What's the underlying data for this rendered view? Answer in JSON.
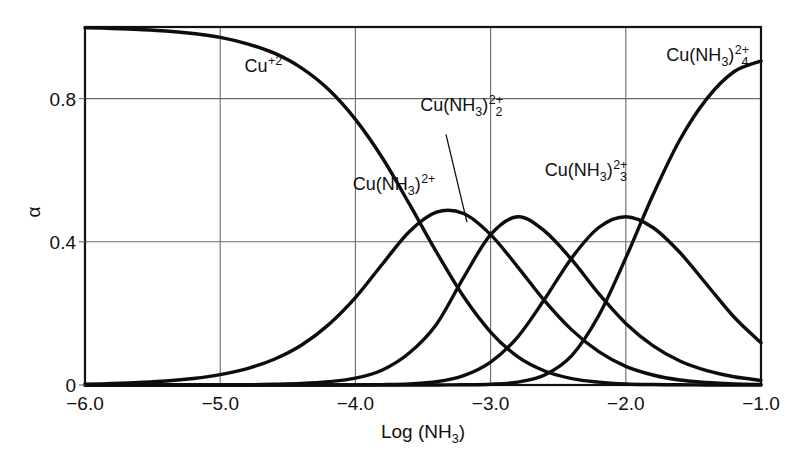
{
  "chart_data": {
    "type": "line",
    "title": "",
    "xlabel_parts": {
      "main": "Log (NH",
      "sub": "3",
      "tail": ")"
    },
    "xlabel": "Log (NH3)",
    "ylabel": "α",
    "xlim": [
      -6.0,
      -1.0
    ],
    "ylim": [
      0.0,
      1.0
    ],
    "xticks": [
      -6.0,
      -5.0,
      -4.0,
      -3.0,
      -2.0,
      -1.0
    ],
    "xtick_labels": [
      "−6.0",
      "−5.0",
      "−4.0",
      "−3.0",
      "−2.0",
      "−1.0"
    ],
    "yticks": [
      0,
      0.4,
      0.8
    ],
    "ytick_labels": [
      "0",
      "0.4",
      "0.8"
    ],
    "grid": "both",
    "legend": "inline-labels",
    "axis_color": "#111111",
    "grid_color": "#6b6b6b",
    "curve_color": "#0d0d0d",
    "background": "#ffffff",
    "x": [
      -6.0,
      -5.8,
      -5.6,
      -5.4,
      -5.2,
      -5.0,
      -4.8,
      -4.6,
      -4.4,
      -4.2,
      -4.0,
      -3.8,
      -3.6,
      -3.4,
      -3.2,
      -3.0,
      -2.8,
      -2.6,
      -2.4,
      -2.2,
      -2.0,
      -1.8,
      -1.6,
      -1.4,
      -1.2,
      -1.0
    ],
    "series": [
      {
        "name": "Cu+2",
        "label_parts": {
          "main": "Cu",
          "sup": "+2"
        },
        "label_x": -4.82,
        "label_y": 0.875,
        "values": [
          0.998,
          0.996,
          0.993,
          0.989,
          0.982,
          0.971,
          0.953,
          0.927,
          0.886,
          0.826,
          0.742,
          0.634,
          0.505,
          0.371,
          0.247,
          0.148,
          0.079,
          0.039,
          0.018,
          0.008,
          0.003,
          0.0013,
          0.0005,
          0.0002,
          0.0001,
          0.0
        ]
      },
      {
        "name": "Cu(NH3)+2",
        "label_parts": {
          "main": "Cu(NH",
          "sub": "3",
          "mid": ")",
          "sup": "2+"
        },
        "label_x": -4.02,
        "label_y": 0.545,
        "peak_x": -3.8,
        "peak_y": 0.49,
        "values": [
          0.002,
          0.004,
          0.007,
          0.011,
          0.018,
          0.029,
          0.046,
          0.072,
          0.111,
          0.168,
          0.244,
          0.338,
          0.429,
          0.483,
          0.479,
          0.42,
          0.33,
          0.235,
          0.154,
          0.093,
          0.052,
          0.028,
          0.014,
          0.007,
          0.003,
          0.0015
        ]
      },
      {
        "name": "Cu(NH3)2+2",
        "label_parts": {
          "main": "Cu(NH",
          "sub": "3",
          "mid": ")",
          "sub2": "2",
          "sup": "2+"
        },
        "label_x": -3.52,
        "label_y": 0.765,
        "peak_x": -3.17,
        "peak_y": 0.47,
        "leader_from": [
          -3.33,
          0.7
        ],
        "leader_to": [
          -3.175,
          0.455
        ],
        "values": [
          0.0,
          0.0,
          0.0,
          0.0001,
          0.0002,
          0.0004,
          0.0009,
          0.0019,
          0.004,
          0.009,
          0.019,
          0.042,
          0.09,
          0.17,
          0.3,
          0.42,
          0.47,
          0.43,
          0.35,
          0.255,
          0.172,
          0.11,
          0.067,
          0.04,
          0.023,
          0.013
        ]
      },
      {
        "name": "Cu(NH3)3+2",
        "label_parts": {
          "main": "Cu(NH",
          "sub": "3",
          "mid": ")",
          "sub2": "3",
          "sup": "2+"
        },
        "label_x": -2.6,
        "label_y": 0.585,
        "peak_x": -2.45,
        "peak_y": 0.5,
        "values": [
          0.0,
          0.0,
          0.0,
          0.0,
          0.0,
          0.0,
          0.0,
          0.0,
          0.0,
          0.0001,
          0.0003,
          0.001,
          0.003,
          0.009,
          0.026,
          0.064,
          0.134,
          0.24,
          0.355,
          0.44,
          0.47,
          0.44,
          0.37,
          0.28,
          0.19,
          0.118
        ]
      },
      {
        "name": "Cu(NH3)4+2",
        "label_parts": {
          "main": "Cu(NH",
          "sub": "3",
          "mid": ")",
          "sub2": "4",
          "sup": "2+"
        },
        "label_x": -1.7,
        "label_y": 0.905,
        "values": [
          0.0,
          0.0,
          0.0,
          0.0,
          0.0,
          0.0,
          0.0,
          0.0,
          0.0,
          0.0,
          0.0,
          0.0,
          0.0,
          0.0001,
          0.0005,
          0.002,
          0.008,
          0.028,
          0.082,
          0.194,
          0.355,
          0.53,
          0.685,
          0.8,
          0.875,
          0.905
        ]
      }
    ]
  }
}
